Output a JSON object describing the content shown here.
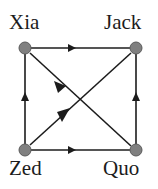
{
  "figure": {
    "type": "directed-graph",
    "background_color": "#ffffff",
    "node_color": "#808080",
    "node_stroke_color": "#5a5a5a",
    "edge_color": "#1c1c1c",
    "label_color": "#1c1c1c",
    "node_radius": 6
  },
  "nodes": [
    {
      "id": "xia",
      "label": "Xia",
      "x": 25,
      "y": 48,
      "label_position": "top-left"
    },
    {
      "id": "jack",
      "label": "Jack",
      "x": 136,
      "y": 48,
      "label_position": "top-right"
    },
    {
      "id": "zed",
      "label": "Zed",
      "x": 25,
      "y": 150,
      "label_position": "bottom-left"
    },
    {
      "id": "quo",
      "label": "Quo",
      "x": 136,
      "y": 150,
      "label_position": "bottom-right"
    }
  ],
  "edges": [
    {
      "id": "xia-jack",
      "from": "xia",
      "to": "jack",
      "kind": "top",
      "arrow_direction": "right"
    },
    {
      "id": "zed-xia",
      "from": "zed",
      "to": "xia",
      "kind": "left",
      "arrow_direction": "up"
    },
    {
      "id": "quo-jack",
      "from": "quo",
      "to": "jack",
      "kind": "right",
      "arrow_direction": "up"
    },
    {
      "id": "zed-quo",
      "from": "zed",
      "to": "quo",
      "kind": "bottom",
      "arrow_direction": "right"
    },
    {
      "id": "xia-quo",
      "from": "xia",
      "to": "quo",
      "kind": "diagonal-down",
      "arrow_direction": "down-right"
    },
    {
      "id": "zed-jack",
      "from": "zed",
      "to": "jack",
      "kind": "diagonal-up",
      "arrow_direction": "up-right"
    }
  ]
}
